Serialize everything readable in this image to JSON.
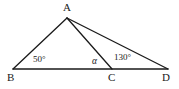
{
  "figure": {
    "type": "geometry-diagram",
    "background_color": "#ffffff",
    "stroke_color": "#1a1a1a",
    "stroke_width": 1.3
  },
  "points": {
    "A": {
      "label": "A",
      "x": 67,
      "y": 18,
      "label_x": 63,
      "label_y": 2
    },
    "B": {
      "label": "B",
      "x": 13,
      "y": 69,
      "label_x": 7,
      "label_y": 72
    },
    "C": {
      "label": "C",
      "x": 112,
      "y": 69,
      "label_x": 108,
      "label_y": 72
    },
    "D": {
      "label": "D",
      "x": 168,
      "y": 69,
      "label_x": 162,
      "label_y": 72
    }
  },
  "segments": [
    {
      "name": "segment-AB",
      "from": "A",
      "to": "B"
    },
    {
      "name": "segment-AC",
      "from": "A",
      "to": "C"
    },
    {
      "name": "segment-AD",
      "from": "A",
      "to": "D"
    },
    {
      "name": "segment-BD",
      "from": "B",
      "to": "D"
    }
  ],
  "angles": [
    {
      "name": "angle-at-B",
      "text": "50°",
      "value": 50,
      "unit": "degrees",
      "at_vertex": "B",
      "label_x": 33,
      "label_y": 55
    },
    {
      "name": "angle-alpha-at-C",
      "text": "α",
      "value": null,
      "unit": "unknown",
      "at_vertex": "C",
      "label_x": 92,
      "label_y": 57
    },
    {
      "name": "angle-130-at-C",
      "text": "130°",
      "value": 130,
      "unit": "degrees",
      "at_vertex": "C",
      "label_x": 114,
      "label_y": 53
    }
  ]
}
